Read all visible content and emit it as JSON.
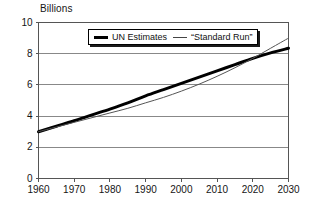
{
  "chart_data": {
    "type": "line",
    "title": "",
    "ylabel": "Billions",
    "xlabel": "",
    "xlim": [
      1960,
      2030
    ],
    "ylim": [
      0,
      10
    ],
    "grid": true,
    "legend_position": "top-center",
    "x_ticks": [
      "1960",
      "1970",
      "1980",
      "1990",
      "2000",
      "2010",
      "2020",
      "2030"
    ],
    "y_ticks": [
      "0",
      "2",
      "4",
      "6",
      "8",
      "10"
    ],
    "x": [
      1960,
      1965,
      1970,
      1975,
      1980,
      1985,
      1990,
      1995,
      2000,
      2005,
      2010,
      2015,
      2020,
      2025,
      2030
    ],
    "series": [
      {
        "name": "UN Estimates",
        "style": "thick-solid",
        "color": "#000000",
        "values": [
          3.0,
          3.35,
          3.7,
          4.08,
          4.45,
          4.85,
          5.3,
          5.7,
          6.1,
          6.5,
          6.9,
          7.3,
          7.7,
          8.05,
          8.35
        ]
      },
      {
        "name": "“Standard Run”",
        "style": "thin-solid",
        "color": "#555555",
        "values": [
          3.0,
          3.3,
          3.6,
          3.9,
          4.2,
          4.5,
          4.85,
          5.2,
          5.6,
          6.05,
          6.55,
          7.1,
          7.7,
          8.35,
          9.0
        ]
      }
    ]
  },
  "legend": {
    "items": [
      {
        "label": "UN Estimates"
      },
      {
        "label": "“Standard Run”"
      }
    ]
  }
}
